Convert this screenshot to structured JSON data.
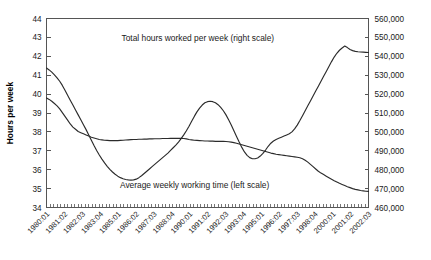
{
  "chart_data": {
    "type": "line",
    "title": "",
    "subtitle": "",
    "xlabel": "",
    "ylabel": "Hours per week",
    "ylabel_right": "",
    "grid": false,
    "legend_position": "inline-annotations",
    "ylim": [
      34,
      44
    ],
    "ylim_right": [
      460000,
      560000
    ],
    "yticks": [
      34,
      35,
      36,
      37,
      38,
      39,
      40,
      41,
      42,
      43,
      44
    ],
    "ytick_labels": [
      "34",
      "35",
      "36",
      "37",
      "38",
      "39",
      "40",
      "41",
      "42",
      "43",
      "44"
    ],
    "yticks_right": [
      460000,
      470000,
      480000,
      490000,
      500000,
      510000,
      520000,
      530000,
      540000,
      550000,
      560000
    ],
    "ytick_labels_right": [
      "460,000",
      "470,000",
      "480,000",
      "490,000",
      "500,000",
      "510,000",
      "520,000",
      "530,000",
      "540,000",
      "550,000",
      "560,000"
    ],
    "xtick_labels": [
      "1980:01",
      "1981:02",
      "1982:03",
      "1983:04",
      "1985:01",
      "1986:02",
      "1987:03",
      "1988:04",
      "1990:01",
      "1991:02",
      "1992:03",
      "1993:04",
      "1995:01",
      "1996:02",
      "1997:03",
      "1998:04",
      "2000:01",
      "2001:02",
      "2002:03"
    ],
    "x_minor_tick_count": 92,
    "annotations": [
      {
        "name": "total-hours-annotation",
        "text": "Total hours worked per week (right scale)",
        "x_frac": 0.47,
        "y_frac": 0.12
      },
      {
        "name": "average-weekly-annotation",
        "text": "Average weekly working time (left scale)",
        "x_frac": 0.46,
        "y_frac": 0.895
      }
    ],
    "series": [
      {
        "name": "Average weekly working time (left scale)",
        "axis": "left",
        "color": "#2b2b2b",
        "values": [
          39.8,
          39.72,
          39.62,
          39.5,
          39.38,
          39.22,
          39.02,
          38.82,
          38.62,
          38.42,
          38.25,
          38.14,
          38.02,
          37.96,
          37.9,
          37.84,
          37.78,
          37.72,
          37.68,
          37.64,
          37.6,
          37.58,
          37.56,
          37.55,
          37.54,
          37.54,
          37.54,
          37.54,
          37.55,
          37.56,
          37.57,
          37.58,
          37.59,
          37.6,
          37.6,
          37.61,
          37.61,
          37.62,
          37.62,
          37.63,
          37.63,
          37.64,
          37.64,
          37.64,
          37.65,
          37.65,
          37.65,
          37.66,
          37.66,
          37.66,
          37.66,
          37.66,
          37.65,
          37.63,
          37.6,
          37.58,
          37.56,
          37.55,
          37.54,
          37.53,
          37.52,
          37.52,
          37.51,
          37.51,
          37.5,
          37.5,
          37.5,
          37.5,
          37.49,
          37.48,
          37.46,
          37.43,
          37.4,
          37.36,
          37.32,
          37.28,
          37.24,
          37.2,
          37.16,
          37.12,
          37.08,
          37.04,
          37.0,
          36.96,
          36.92,
          36.88,
          36.85,
          36.82,
          36.8,
          36.78,
          36.76,
          36.74,
          36.72,
          36.7,
          36.68,
          36.66,
          36.63,
          36.58,
          36.5,
          36.4,
          36.28,
          36.16,
          36.04,
          35.92,
          35.82,
          35.74,
          35.66,
          35.58,
          35.5,
          35.42,
          35.35,
          35.28,
          35.22,
          35.16,
          35.1,
          35.05,
          35.0,
          34.96,
          34.93,
          34.9,
          34.88,
          34.86,
          34.85
        ]
      },
      {
        "name": "Total hours worked per week (right scale)",
        "axis": "right",
        "color": "#2b2b2b",
        "values": [
          533800,
          532800,
          531600,
          530200,
          528600,
          526800,
          524600,
          522000,
          519400,
          516800,
          514200,
          511600,
          509000,
          506400,
          503800,
          501200,
          498400,
          495600,
          492800,
          490200,
          487800,
          485600,
          483600,
          481800,
          480200,
          478800,
          477600,
          476600,
          475800,
          475200,
          474800,
          474600,
          474500,
          474600,
          475000,
          475800,
          476800,
          478000,
          479200,
          480400,
          481600,
          482800,
          484000,
          485200,
          486400,
          487600,
          488800,
          490200,
          491600,
          493000,
          494600,
          496400,
          498400,
          500600,
          503000,
          505600,
          508200,
          510600,
          512600,
          514200,
          515400,
          516000,
          516200,
          516000,
          515400,
          514400,
          513000,
          511200,
          509000,
          506400,
          503600,
          500600,
          497600,
          494600,
          491800,
          489400,
          487600,
          486400,
          485800,
          485800,
          486200,
          487200,
          488600,
          490400,
          492400,
          494000,
          495200,
          496000,
          496600,
          497200,
          497800,
          498400,
          499000,
          500000,
          501600,
          503600,
          506000,
          508600,
          511200,
          513800,
          516400,
          519000,
          521600,
          524200,
          526800,
          529400,
          532000,
          534600,
          537200,
          539600,
          541600,
          543200,
          544400,
          545400,
          544600,
          543600,
          543000,
          542600,
          542400,
          542300,
          542200,
          542100,
          542000
        ]
      }
    ]
  },
  "axis_titles": {
    "left": "Hours per week"
  }
}
